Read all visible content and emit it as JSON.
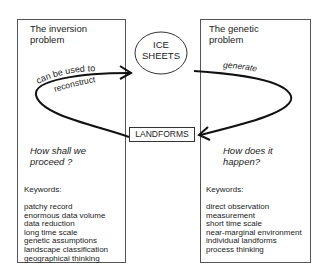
{
  "left_panel": {
    "title": "The inversion\nproblem",
    "arrow_label_line1": "can be used to",
    "arrow_label_line2": "reconstruct",
    "question": "How shall we\nproceed ?",
    "keywords_heading": "Keywords:",
    "keywords": [
      "patchy record",
      "enormous data volume",
      "data reduction",
      "long time scale",
      "genetic assumptions",
      "landscape classification",
      "geographical thinking"
    ]
  },
  "right_panel": {
    "title": "The genetic\nproblem",
    "arrow_label": "generate",
    "question": "How does it\nhappen?",
    "keywords_heading": "Keywords:",
    "keywords": [
      "direct observation",
      "measurement",
      "short time scale",
      "near-marginal environment",
      "individual landforms",
      "process thinking"
    ]
  },
  "center": {
    "ice_sheets_label": "ICE\nSHEETS",
    "landforms_label": "LANDFORMS"
  }
}
